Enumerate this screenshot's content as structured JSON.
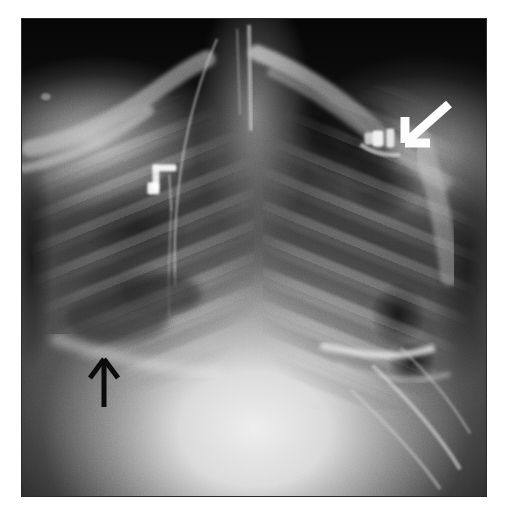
{
  "image": {
    "kind": "chest-radiograph",
    "modality": "X-ray",
    "projection": "AP portable chest",
    "alt": "Anteroposterior chest radiograph showing dense right lower lung opacity and a lucency in the left upper zone",
    "plate": {
      "left": 21,
      "top": 18,
      "width": 466,
      "height": 479,
      "background_color": "#0a0a0a",
      "page_background_color": "#ffffff",
      "border_color": "#2b2b2b"
    }
  },
  "annotations": [
    {
      "name": "white-arrow",
      "label": "White arrow",
      "color": "#fdfdfd",
      "points_to": "left upper zone lucency",
      "direction": "down-left",
      "tip": {
        "x": 405,
        "y": 143
      },
      "tail": {
        "x": 449,
        "y": 104
      },
      "barb_a": {
        "x": 405,
        "y": 117
      },
      "barb_b": {
        "x": 430,
        "y": 143
      },
      "stroke_width": 9
    },
    {
      "name": "black-arrow",
      "label": "Black arrow",
      "color": "#0b0b0b",
      "points_to": "right lower lung opacity",
      "direction": "up",
      "tip": {
        "x": 104,
        "y": 359
      },
      "tail": {
        "x": 104,
        "y": 407
      },
      "barb_a": {
        "x": 90,
        "y": 378
      },
      "barb_b": {
        "x": 118,
        "y": 378
      },
      "stroke_width": 5
    }
  ],
  "radiopaque_devices": [
    {
      "name": "metallic-clip-left-upper",
      "label": "Metallic clip / lead, left upper zone",
      "x": 372,
      "y": 134,
      "width": 26,
      "height": 17,
      "color": "#f2f2f2"
    },
    {
      "name": "metallic-marker-right-mid",
      "label": "Metallic marker / EKG lead, right mid zone",
      "x": 160,
      "y": 177,
      "width": 22,
      "height": 26,
      "color": "#f5f5f5"
    },
    {
      "name": "lead-wire-right",
      "label": "Monitor lead wire, right hemithorax",
      "color": "#d8d8d8"
    },
    {
      "name": "tube-midline",
      "label": "Vertical tube / trachea, midline",
      "color": "#cfcfcf"
    }
  ],
  "anatomy_regions": [
    {
      "name": "apex-dark-field",
      "label": "Dark background above shoulders"
    },
    {
      "name": "right-clavicle",
      "label": "Right clavicle"
    },
    {
      "name": "left-clavicle",
      "label": "Left clavicle"
    },
    {
      "name": "right-lung-field",
      "label": "Right lung field with rib shadows"
    },
    {
      "name": "left-lung-field",
      "label": "Left lung field with upper zone lucency"
    },
    {
      "name": "mediastinum",
      "label": "Bright mediastinal / cardiac silhouette"
    },
    {
      "name": "left-hemidiaphragm",
      "label": "Left hemidiaphragm and gastric bubble"
    },
    {
      "name": "right-lower-opacity",
      "label": "Right lower zone opacity"
    }
  ]
}
